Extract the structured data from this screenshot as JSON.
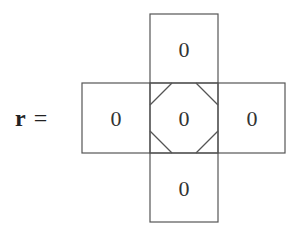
{
  "equation": {
    "variable": "r",
    "operator": "="
  },
  "stencil": {
    "top": "0",
    "left": "0",
    "center": "0",
    "right": "0",
    "bottom": "0"
  },
  "colors": {
    "line": "#555555",
    "text": "#333333",
    "background": "#ffffff"
  }
}
